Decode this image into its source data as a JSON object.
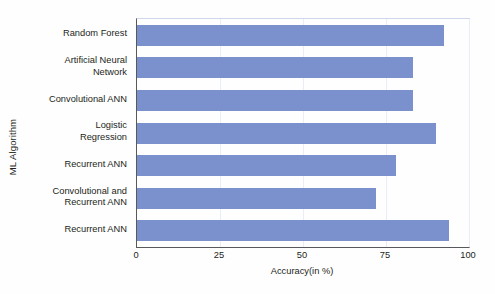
{
  "chart_data": {
    "type": "bar",
    "orientation": "horizontal",
    "title": "",
    "xlabel": "Accuracy(in %)",
    "ylabel": "ML Algorithm",
    "categories": [
      "Random Forest",
      "Artificial Neural\nNetwork",
      "Convolutional ANN",
      "Logistic\nRegression",
      "Recurrent ANN",
      "Convolutional and\nRecurrent ANN",
      "Recurrent ANN"
    ],
    "values": [
      92.5,
      83,
      83,
      90,
      78,
      72,
      94
    ],
    "xlim": [
      0,
      100
    ],
    "xticks": [
      0,
      25,
      50,
      75,
      100
    ],
    "xtick_labels": [
      "0",
      "25",
      "50",
      "75",
      "100"
    ],
    "grid": true,
    "grid_axis": "x",
    "legend": null,
    "bar_color": "#7b91cd",
    "axis_color": "#58595b",
    "grid_color": "#e8edf7",
    "background": "#fefefe"
  }
}
